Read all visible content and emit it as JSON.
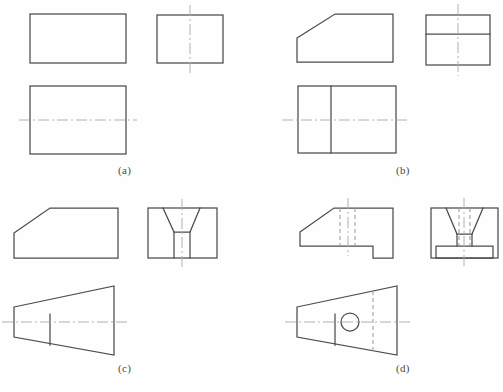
{
  "sheet": {
    "width": 503,
    "height": 392,
    "background": "#fefefe",
    "title": "Orthographic Three-View Projection Exercise",
    "line_colors": {
      "visible_outline": "#4c4c4c",
      "hidden_line": "#9a9a9a",
      "center_line": "#a9a9a9"
    }
  },
  "panels": [
    {
      "id": "a",
      "caption": "(a)",
      "caption_x": 118,
      "caption_y": 166,
      "description": "Rectangular block — three views, all plain rectangles",
      "views": [
        {
          "name": "front-view",
          "shape": "rectangle",
          "x": 30,
          "y": 14,
          "width": 96,
          "height": 49,
          "center_lines": []
        },
        {
          "name": "side-view",
          "shape": "rectangle",
          "x": 157,
          "y": 15,
          "width": 66,
          "height": 48,
          "center_lines": [
            "vertical"
          ]
        },
        {
          "name": "top-view",
          "shape": "rectangle",
          "x": 30,
          "y": 86,
          "width": 96,
          "height": 68,
          "center_lines": [
            "horizontal"
          ]
        }
      ]
    },
    {
      "id": "b",
      "caption": "(b)",
      "caption_x": 398,
      "caption_y": 166,
      "description": "Block with chamfered top-left corner",
      "views": [
        {
          "name": "front-view",
          "shape": "chamfered-rectangle",
          "x": 297,
          "y": 14,
          "width": 96,
          "height": 48,
          "chamfer_x": 38,
          "chamfer_y": 24,
          "center_lines": []
        },
        {
          "name": "side-view",
          "shape": "rectangle-with-horizontal-divider",
          "x": 426,
          "y": 15,
          "width": 64,
          "height": 50,
          "divider_y": 34,
          "center_lines": [
            "vertical"
          ]
        },
        {
          "name": "top-view",
          "shape": "rectangle-with-vertical-divider",
          "x": 298,
          "y": 86,
          "width": 98,
          "height": 67,
          "divider_x": 331,
          "center_lines": [
            "horizontal"
          ]
        }
      ]
    },
    {
      "id": "c",
      "caption": "(c)",
      "caption_x": 118,
      "caption_y": 364,
      "description": "Tapered block with chamfer and dovetail groove",
      "views": [
        {
          "name": "front-view",
          "shape": "chamfered-rectangle",
          "x": 14,
          "y": 208,
          "width": 104,
          "height": 50,
          "chamfer_x": 36,
          "chamfer_y": 25,
          "center_lines": []
        },
        {
          "name": "side-view",
          "shape": "rectangle-with-dovetail-groove",
          "x": 148,
          "y": 208,
          "width": 69,
          "height": 50,
          "groove_top_left_x": 163,
          "groove_top_right_x": 200,
          "groove_bottom_left_x": 174,
          "groove_bottom_right_x": 190,
          "groove_bottom_y": 232,
          "center_lines": [
            "vertical"
          ]
        },
        {
          "name": "top-view",
          "shape": "trapezoid-with-divider",
          "left_x": 14,
          "left_top_y": 307,
          "left_bottom_y": 337,
          "right_x": 114,
          "right_top_y": 286,
          "right_bottom_y": 355,
          "divider_x": 50,
          "center_lines": [
            "horizontal"
          ]
        }
      ]
    },
    {
      "id": "d",
      "caption": "(d)",
      "caption_x": 398,
      "caption_y": 364,
      "description": "Tapered block with chamfer, notch, dovetail rib, base plate and a through hole",
      "views": [
        {
          "name": "front-view",
          "shape": "chamfered-rectangle-with-notch",
          "x": 300,
          "y": 208,
          "width": 93,
          "height": 50,
          "chamfer_x": 34,
          "chamfer_y": 24,
          "notch_x": 373,
          "notch_y": 246,
          "hidden_lines_x": [
            340,
            355
          ],
          "center_lines": [
            "vertical"
          ]
        },
        {
          "name": "side-view",
          "shape": "dovetail-with-base-plate",
          "x": 431,
          "y": 208,
          "width": 67,
          "height": 50,
          "dovetail_top_left_x": 446,
          "dovetail_top_right_x": 483,
          "dovetail_bottom_left_x": 457,
          "dovetail_bottom_right_x": 472,
          "base_plate_y": 246,
          "base_plate_x": 436,
          "base_plate_width": 57,
          "hidden_lines_x": [
            459,
            470
          ],
          "center_lines": [
            "vertical"
          ]
        },
        {
          "name": "top-view",
          "shape": "trapezoid-with-hole",
          "left_x": 297,
          "left_top_y": 307,
          "left_bottom_y": 337,
          "right_x": 397,
          "right_top_y": 286,
          "right_bottom_y": 355,
          "divider_x": 335,
          "hole_cx": 350,
          "hole_cy": 322,
          "hole_r": 9,
          "hidden_line_x": 373,
          "center_lines": [
            "horizontal"
          ]
        }
      ]
    }
  ]
}
